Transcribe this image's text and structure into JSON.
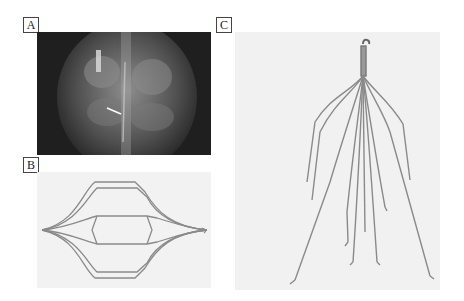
{
  "figure": {
    "panels": [
      {
        "id": "A",
        "label": "A",
        "content": "x-ray radiograph of spine with implanted filter, arrow indicating device"
      },
      {
        "id": "B",
        "label": "B",
        "content": "photograph of double-basket wire filter, side view"
      },
      {
        "id": "C",
        "label": "C",
        "content": "photograph of conical wire filter with hook apex and hooked legs"
      }
    ]
  },
  "colors": {
    "xray_bg": "#222222",
    "photo_bg": "#f2f2f2",
    "wire": "#8a8a8a",
    "label_border": "#444444"
  }
}
